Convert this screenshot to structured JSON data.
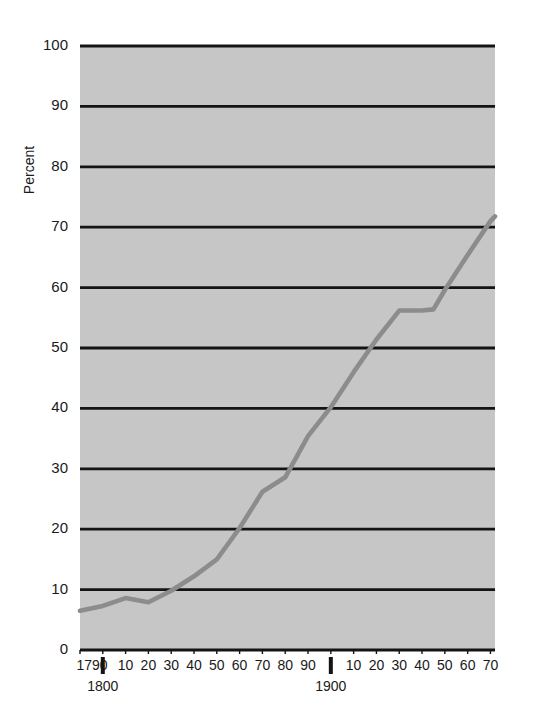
{
  "chart_data": {
    "type": "line",
    "title": "",
    "xlabel": "",
    "ylabel": "Percent",
    "ylim": [
      0,
      100
    ],
    "xlim": [
      1790,
      1972
    ],
    "grid": "horizontal",
    "legend": "none",
    "y_ticks": [
      0,
      10,
      20,
      30,
      40,
      50,
      60,
      70,
      80,
      90,
      100
    ],
    "y_tick_labels": [
      "0",
      "10",
      "20",
      "30",
      "40",
      "50",
      "60",
      "70",
      "80",
      "90",
      "100"
    ],
    "x_ticks": [
      1790,
      1800,
      1810,
      1820,
      1830,
      1840,
      1850,
      1860,
      1870,
      1880,
      1890,
      1900,
      1910,
      1920,
      1930,
      1940,
      1950,
      1960,
      1970
    ],
    "x_tick_labels": [
      "1790",
      "",
      "10",
      "20",
      "30",
      "40",
      "50",
      "60",
      "70",
      "80",
      "90",
      "",
      "10",
      "20",
      "30",
      "40",
      "50",
      "60",
      "70"
    ],
    "x_era_markers": [
      {
        "x": 1800,
        "label": "1800"
      },
      {
        "x": 1900,
        "label": "1900"
      }
    ],
    "x": [
      1790,
      1800,
      1810,
      1820,
      1830,
      1840,
      1850,
      1860,
      1870,
      1880,
      1890,
      1900,
      1910,
      1920,
      1930,
      1940,
      1945,
      1950,
      1960,
      1970,
      1972
    ],
    "values": [
      6.5,
      7.3,
      8.6,
      7.9,
      9.8,
      12.2,
      15.0,
      20.2,
      26.2,
      28.6,
      35.4,
      40.2,
      46.0,
      51.4,
      56.2,
      56.2,
      56.4,
      59.6,
      65.4,
      71.0,
      71.8
    ],
    "series": [
      {
        "name": "Percent urban",
        "color": "#8c8c8c",
        "x": [
          1790,
          1800,
          1810,
          1820,
          1830,
          1840,
          1850,
          1860,
          1870,
          1880,
          1890,
          1900,
          1910,
          1920,
          1930,
          1940,
          1945,
          1950,
          1960,
          1970,
          1972
        ],
        "values": [
          6.5,
          7.3,
          8.6,
          7.9,
          9.8,
          12.2,
          15.0,
          20.2,
          26.2,
          28.6,
          35.4,
          40.2,
          46.0,
          51.4,
          56.2,
          56.2,
          56.4,
          59.6,
          65.4,
          71.0,
          71.8
        ]
      }
    ]
  },
  "colors": {
    "plot_background": "#c6c6c6",
    "page_background": "#ffffff",
    "gridline": "#141414",
    "line": "#8c8c8c",
    "text": "#1a1a1a"
  },
  "axis": {
    "y_title": "Percent"
  }
}
